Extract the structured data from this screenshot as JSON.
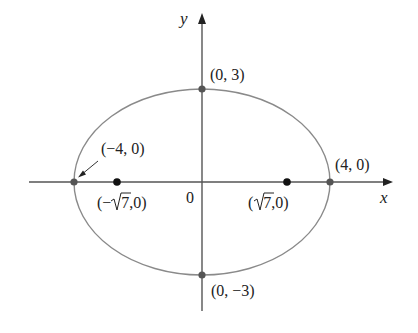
{
  "figure": {
    "colors": {
      "axis": "#555555",
      "ellipse": "#8a8a8a",
      "vertex_point": "#555555",
      "focus_point": "#111111",
      "text": "#222222"
    },
    "axes": {
      "x_label": "x",
      "y_label": "y",
      "origin_label": "0"
    },
    "ellipse": {
      "center": [
        0,
        0
      ],
      "semi_major_a": 4,
      "semi_minor_b": 3,
      "focal_distance_c": "√7"
    },
    "points": {
      "left_vertex": {
        "label": "(−4, 0)",
        "coords": [
          -4,
          0
        ],
        "kind": "vertex"
      },
      "right_vertex": {
        "label": "(4, 0)",
        "coords": [
          4,
          0
        ],
        "kind": "vertex"
      },
      "top_covertex": {
        "label": "(0, 3)",
        "coords": [
          0,
          3
        ],
        "kind": "co-vertex"
      },
      "bottom_covertex": {
        "label": "(0, −3)",
        "coords": [
          0,
          -3
        ],
        "kind": "co-vertex"
      },
      "left_focus": {
        "label_prefix": "(−",
        "label_radical": "7",
        "label_suffix": ",0)",
        "label": "(−√7,0)",
        "coords": [
          "-√7",
          0
        ],
        "kind": "focus"
      },
      "right_focus": {
        "label_prefix": "(",
        "label_radical": "7",
        "label_suffix": ",0)",
        "label": "(√7,0)",
        "coords": [
          "√7",
          0
        ],
        "kind": "focus"
      }
    }
  }
}
